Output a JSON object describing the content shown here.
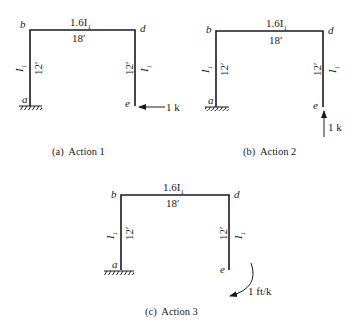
{
  "figures": [
    {
      "id": "a",
      "caption": "(a)  Action 1",
      "nodes": {
        "top_left": "b",
        "top_right": "d",
        "bottom_left": "a",
        "bottom_right": "e"
      },
      "beam": {
        "inertia": "1.6I",
        "inertia_sub": "1",
        "length": "18′"
      },
      "left_column": {
        "inertia": "I",
        "inertia_sub": "1",
        "length": "12′"
      },
      "right_column": {
        "inertia": "I",
        "inertia_sub": "1",
        "length": "12′"
      },
      "support": "fixed-at-a",
      "load": {
        "type": "horizontal-force",
        "direction": "left",
        "label": "1 k",
        "at": "e"
      }
    },
    {
      "id": "b",
      "caption": "(b)  Action 2",
      "nodes": {
        "top_left": "b",
        "top_right": "d",
        "bottom_left": "a",
        "bottom_right": "e"
      },
      "beam": {
        "inertia": "1.6I",
        "inertia_sub": "1",
        "length": "18′"
      },
      "left_column": {
        "inertia": "I",
        "inertia_sub": "1",
        "length": "12′"
      },
      "right_column": {
        "inertia": "I",
        "inertia_sub": "1",
        "length": "12′"
      },
      "support": "fixed-at-a",
      "load": {
        "type": "vertical-force",
        "direction": "up",
        "label": "1 k",
        "at": "e"
      }
    },
    {
      "id": "c",
      "caption": "(c)  Action 3",
      "nodes": {
        "top_left": "b",
        "top_right": "d",
        "bottom_left": "a",
        "bottom_right": "e"
      },
      "beam": {
        "inertia": "1.6I",
        "inertia_sub": "1",
        "length": "18′"
      },
      "left_column": {
        "inertia": "I",
        "inertia_sub": "1",
        "length": "12′"
      },
      "right_column": {
        "inertia": "I",
        "inertia_sub": "1",
        "length": "12′"
      },
      "support": "fixed-at-a",
      "load": {
        "type": "moment",
        "direction": "clockwise",
        "label": "1 ft/k",
        "at": "e"
      }
    }
  ]
}
